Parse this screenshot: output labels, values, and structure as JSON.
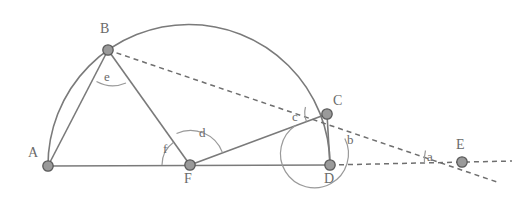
{
  "figure": {
    "type": "geometry-diagram",
    "background_color": "#ffffff",
    "stroke_color": "#6f6f6f",
    "vertex_fill": "#9a9a9a",
    "vertex_stroke": "#5a5a5a",
    "label_color": "#6a6a6a",
    "points": [
      {
        "id": "A",
        "label": "A",
        "x": 48,
        "y": 166,
        "label_x": 28,
        "label_y": 146
      },
      {
        "id": "B",
        "label": "B",
        "x": 108,
        "y": 50,
        "label_x": 100,
        "label_y": 22
      },
      {
        "id": "C",
        "label": "C",
        "x": 327,
        "y": 114,
        "label_x": 333,
        "label_y": 94
      },
      {
        "id": "D",
        "label": "D",
        "x": 330,
        "y": 165,
        "label_x": 324,
        "label_y": 172
      },
      {
        "id": "E",
        "label": "E",
        "x": 462,
        "y": 162,
        "label_x": 456,
        "label_y": 138
      },
      {
        "id": "F",
        "label": "F",
        "x": 190,
        "y": 165,
        "label_x": 184,
        "label_y": 172
      }
    ],
    "angles": [
      {
        "id": "a",
        "label": "a",
        "vertex": "E",
        "label_x": 427,
        "label_y": 150
      },
      {
        "id": "b",
        "label": "b",
        "vertex": "C",
        "label_x": 347,
        "label_y": 133
      },
      {
        "id": "c",
        "label": "c",
        "vertex": "C",
        "label_x": 292,
        "label_y": 110
      },
      {
        "id": "d",
        "label": "d",
        "vertex": "F",
        "label_x": 199,
        "label_y": 126
      },
      {
        "id": "e",
        "label": "e",
        "vertex": "B",
        "label_x": 104,
        "label_y": 70
      },
      {
        "id": "f",
        "label": "f",
        "vertex": "F",
        "label_x": 163,
        "label_y": 142
      }
    ],
    "segments": [
      {
        "id": "AD",
        "from": "A",
        "to": "D",
        "style": "solid"
      },
      {
        "id": "AB",
        "from": "A",
        "to": "B",
        "style": "solid"
      },
      {
        "id": "BF",
        "from": "B",
        "to": "F",
        "style": "solid"
      },
      {
        "id": "FC",
        "from": "F",
        "to": "C",
        "style": "solid"
      },
      {
        "id": "CD",
        "from": "C",
        "to": "D",
        "style": "solid"
      },
      {
        "id": "BE",
        "from": "B",
        "to": "E",
        "style": "dashed"
      },
      {
        "id": "DE",
        "from": "D",
        "to": "E",
        "style": "dashed"
      }
    ],
    "arcs": [
      {
        "id": "semicircle-ABCD",
        "from": "A",
        "to": "D",
        "through": [
          "B",
          "C"
        ],
        "style": "solid"
      }
    ]
  }
}
